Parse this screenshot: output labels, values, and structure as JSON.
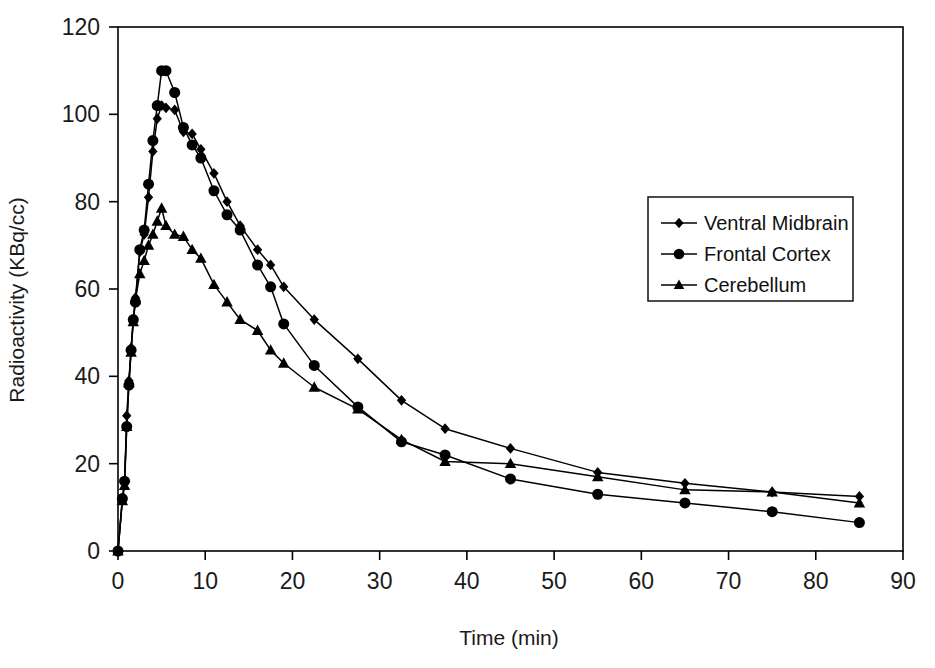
{
  "chart_data": {
    "type": "line",
    "title": "",
    "xlabel": "Time (min)",
    "ylabel": "Radioactivity (KBq/cc)",
    "xlim": [
      0,
      90
    ],
    "ylim": [
      0,
      120
    ],
    "xticks": [
      0,
      10,
      20,
      30,
      40,
      50,
      60,
      70,
      80,
      90
    ],
    "yticks": [
      0,
      20,
      40,
      60,
      80,
      100,
      120
    ],
    "grid": false,
    "legend_position": "center-right",
    "series": [
      {
        "name": "Ventral Midbrain",
        "marker": "diamond",
        "color": "#000000",
        "x": [
          0,
          0.5,
          0.75,
          1,
          1.25,
          1.5,
          1.75,
          2,
          2.5,
          3,
          3.5,
          4,
          4.5,
          5,
          5.5,
          6.5,
          7.5,
          8.5,
          9.5,
          11,
          12.5,
          14,
          16,
          17.5,
          19,
          22.5,
          27.5,
          32.5,
          37.5,
          45,
          55,
          65,
          75,
          85
        ],
        "y": [
          0,
          12,
          15.5,
          31,
          39,
          46.5,
          53,
          58,
          68.5,
          72.5,
          81,
          91.5,
          99,
          102,
          101.5,
          101,
          96,
          95.5,
          92,
          86.5,
          80,
          74.5,
          69,
          65.5,
          60.5,
          53,
          44,
          34.5,
          28,
          23.5,
          18,
          15.5,
          13.5,
          12.5
        ]
      },
      {
        "name": "Frontal Cortex",
        "marker": "circle",
        "color": "#000000",
        "x": [
          0,
          0.5,
          0.75,
          1,
          1.25,
          1.5,
          1.75,
          2,
          2.5,
          3,
          3.5,
          4,
          4.5,
          5,
          5.5,
          6.5,
          7.5,
          8.5,
          9.5,
          11,
          12.5,
          14,
          16,
          17.5,
          19,
          22.5,
          27.5,
          32.5,
          37.5,
          45,
          55,
          65,
          75,
          85
        ],
        "y": [
          0,
          12,
          16,
          28.5,
          38,
          46,
          53,
          57,
          69,
          73.5,
          84,
          94,
          102,
          110,
          110,
          105,
          97,
          93,
          90,
          82.5,
          77,
          73.5,
          65.5,
          60.5,
          52,
          42.5,
          33,
          25,
          22,
          16.5,
          13,
          11,
          9,
          6.5
        ]
      },
      {
        "name": "Cerebellum",
        "marker": "triangle",
        "color": "#000000",
        "x": [
          0,
          0.5,
          0.75,
          1,
          1.25,
          1.5,
          1.75,
          2,
          2.5,
          3,
          3.5,
          4,
          4.5,
          5,
          5.5,
          6.5,
          7.5,
          8.5,
          9.5,
          11,
          12.5,
          14,
          16,
          17.5,
          19,
          22.5,
          27.5,
          32.5,
          37.5,
          45,
          55,
          65,
          75,
          85
        ],
        "y": [
          0,
          11.5,
          15,
          28.5,
          38.5,
          45.5,
          52.5,
          57.5,
          63.5,
          66.5,
          70,
          72.5,
          75.5,
          78.5,
          74.5,
          72.5,
          72,
          69,
          67,
          61,
          57,
          53,
          50.5,
          46,
          43,
          37.5,
          32.5,
          25.5,
          20.5,
          20,
          17,
          14,
          13.5,
          11
        ]
      }
    ]
  },
  "axes": {
    "x_title": "Time (min)",
    "y_title": "Radioactivity (KBq/cc)",
    "x_tick_labels": [
      "0",
      "10",
      "20",
      "30",
      "40",
      "50",
      "60",
      "70",
      "80",
      "90"
    ],
    "y_tick_labels": [
      "0",
      "20",
      "40",
      "60",
      "80",
      "100",
      "120"
    ]
  },
  "legend": {
    "entries": [
      {
        "label": "Ventral Midbrain",
        "marker": "diamond"
      },
      {
        "label": "Frontal Cortex",
        "marker": "circle"
      },
      {
        "label": "Cerebellum",
        "marker": "triangle"
      }
    ]
  }
}
